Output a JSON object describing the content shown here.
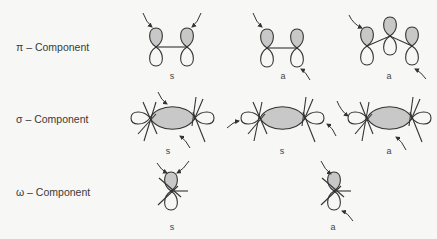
{
  "rows": [
    {
      "label": "π – Component",
      "top": 41,
      "diagrams": [
        {
          "symmetry": "s",
          "label_x": 172,
          "label_y": 71
        },
        {
          "symmetry": "a",
          "label_x": 283,
          "label_y": 71
        },
        {
          "symmetry": "a",
          "label_x": 389,
          "label_y": 71
        }
      ]
    },
    {
      "label": "σ – Component",
      "top": 113,
      "diagrams": [
        {
          "symmetry": "s",
          "label_x": 168,
          "label_y": 146
        },
        {
          "symmetry": "s",
          "label_x": 282,
          "label_y": 146
        },
        {
          "symmetry": "a",
          "label_x": 389,
          "label_y": 146
        }
      ]
    },
    {
      "label": "ω – Component",
      "top": 186,
      "diagrams": [
        {
          "symmetry": "s",
          "label_x": 172,
          "label_y": 222
        },
        {
          "symmetry": "a",
          "label_x": 333,
          "label_y": 222
        }
      ]
    }
  ],
  "colors": {
    "shaded_lobe": "#c8c8c8",
    "line": "#333333",
    "background": "#f7f7f5"
  }
}
